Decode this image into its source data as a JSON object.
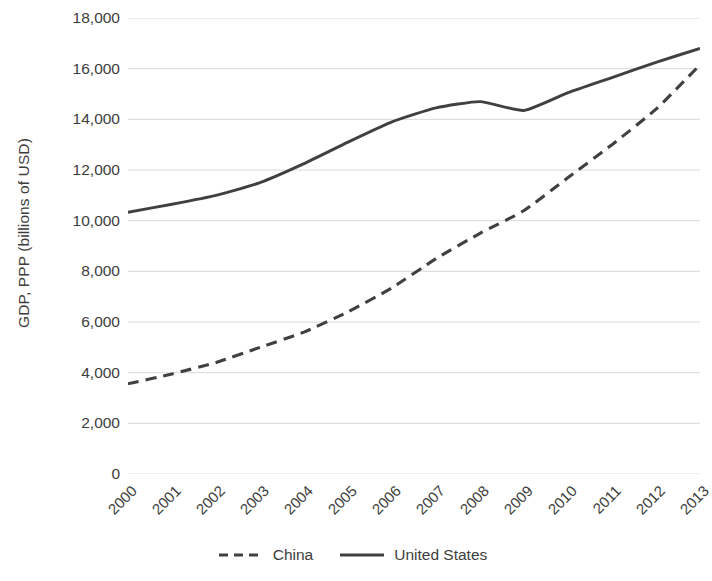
{
  "chart_data": {
    "type": "line",
    "title": "",
    "xlabel": "",
    "ylabel": "GDP, PPP (billions of USD)",
    "x": [
      "2000",
      "2001",
      "2002",
      "2003",
      "2004",
      "2005",
      "2006",
      "2007",
      "2008",
      "2009",
      "2010",
      "2011",
      "2012",
      "2013"
    ],
    "categories": [
      "2000",
      "2001",
      "2002",
      "2003",
      "2004",
      "2005",
      "2006",
      "2007",
      "2008",
      "2009",
      "2010",
      "2011",
      "2012",
      "2013"
    ],
    "ylim": [
      0,
      18000
    ],
    "xlim": [
      "2000",
      "2013"
    ],
    "y_ticks": [
      "0",
      "2,000",
      "4,000",
      "6,000",
      "8,000",
      "10,000",
      "12,000",
      "14,000",
      "16,000",
      "18,000"
    ],
    "y_tick_values": [
      0,
      2000,
      4000,
      6000,
      8000,
      10000,
      12000,
      14000,
      16000,
      18000
    ],
    "grid": true,
    "grid_axis": "y",
    "grid_color": "#d9d9d9",
    "legend_position": "bottom",
    "series": [
      {
        "name": "China",
        "style": "dashed",
        "color": "#404040",
        "values": [
          3560,
          3950,
          4400,
          5000,
          5600,
          6400,
          7350,
          8500,
          9500,
          10400,
          11700,
          13000,
          14400,
          16150
        ]
      },
      {
        "name": "United States",
        "style": "solid",
        "color": "#404040",
        "values": [
          10330,
          10650,
          11000,
          11500,
          12250,
          13100,
          13900,
          14450,
          14700,
          14350,
          15050,
          15650,
          16250,
          16800
        ]
      }
    ]
  },
  "legend": {
    "items": [
      {
        "label": "China",
        "style": "dashed"
      },
      {
        "label": "United States",
        "style": "solid"
      }
    ]
  }
}
